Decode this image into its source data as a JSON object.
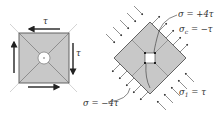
{
  "diagram": {
    "title": "",
    "colors": {
      "fill": "#c8c8c8",
      "stroke": "#555555",
      "arrow": "#222222",
      "thin": "#bbbbbb",
      "text": "#333333"
    },
    "left_element": {
      "description": "Square element under pure shear",
      "labels": {
        "top_shear": "τ",
        "right_shear": "τ"
      }
    },
    "right_element": {
      "description": "Element rotated 45° with principal stresses",
      "labels": {
        "top_sigma": "σ = +4τ",
        "sigma_c_main": "σ",
        "sigma_c_sub": "c",
        "sigma_c_rest": " = −τ",
        "sigma_1_main": "σ",
        "sigma_1_sub": "1",
        "sigma_1_rest": " = τ",
        "bottom_sigma": "σ = −4τ"
      }
    }
  }
}
